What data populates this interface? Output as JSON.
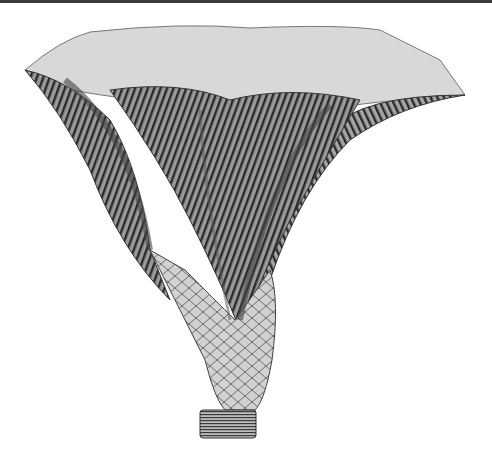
{
  "image": {
    "subject": "crinoid fossil engraving",
    "description": "Monochrome scientific engraving of a fossil crinoid calyx with spreading ribbed arms and segmented stem",
    "colors": {
      "background": "#ffffff",
      "ink_dark": "#1e1e1e",
      "ink_mid": "#6e6e6e",
      "ink_light": "#bdbdbd",
      "top_border": "#3a3a3a"
    }
  }
}
